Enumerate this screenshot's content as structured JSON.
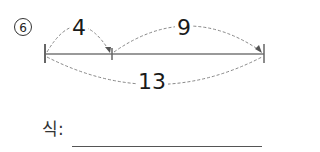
{
  "problem": {
    "number": "6",
    "number_glyph": "⑥"
  },
  "diagram": {
    "segment_a_label": "4",
    "segment_b_label": "9",
    "total_label": "13",
    "line_color": "#777777",
    "dash_color": "#888888"
  },
  "answer": {
    "expression_label": "식:",
    "expression_value": ""
  }
}
